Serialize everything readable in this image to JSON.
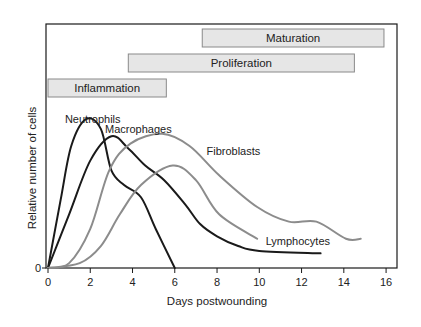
{
  "chart_data": {
    "type": "line",
    "title": "",
    "xlabel": "Days postwounding",
    "ylabel": "Relative number of cells",
    "xlim": [
      0,
      16.5
    ],
    "ylim": [
      0,
      100
    ],
    "x_ticks": [
      0,
      2,
      4,
      6,
      8,
      10,
      12,
      14,
      16
    ],
    "y_ticks": [
      0
    ],
    "grid": false,
    "legend": "inline labels",
    "phases": [
      {
        "name": "Inflammation",
        "start": 0,
        "end": 5.6
      },
      {
        "name": "Proliferation",
        "start": 3.8,
        "end": 14.5
      },
      {
        "name": "Maturation",
        "start": 7.3,
        "end": 15.9
      }
    ],
    "series": [
      {
        "name": "Neutrophils",
        "color": "#1a1a1a",
        "points": [
          [
            0,
            0
          ],
          [
            0.6,
            28
          ],
          [
            1.1,
            50
          ],
          [
            1.8,
            61
          ],
          [
            2.5,
            57
          ],
          [
            3.0,
            40
          ],
          [
            3.6,
            34
          ],
          [
            4.4,
            29
          ],
          [
            5.1,
            16
          ],
          [
            6.0,
            0
          ]
        ]
      },
      {
        "name": "Macrophages",
        "color": "#1a1a1a",
        "points": [
          [
            0,
            0
          ],
          [
            1.0,
            22
          ],
          [
            2.0,
            44
          ],
          [
            3.0,
            54
          ],
          [
            3.8,
            49
          ],
          [
            4.6,
            42
          ],
          [
            5.5,
            36
          ],
          [
            6.5,
            26
          ],
          [
            7.2,
            18
          ],
          [
            8.0,
            13
          ],
          [
            9.0,
            9
          ],
          [
            10.0,
            7
          ],
          [
            12.9,
            6
          ]
        ]
      },
      {
        "name": "Fibroblasts",
        "color": "#8c8c8c",
        "points": [
          [
            0,
            0
          ],
          [
            1.0,
            2
          ],
          [
            2.0,
            16
          ],
          [
            2.9,
            40
          ],
          [
            3.9,
            51
          ],
          [
            5.4,
            55
          ],
          [
            6.7,
            50
          ],
          [
            8.1,
            38
          ],
          [
            9.9,
            25
          ],
          [
            11.4,
            19
          ],
          [
            12.7,
            19
          ],
          [
            14.1,
            12
          ],
          [
            14.8,
            12
          ]
        ]
      },
      {
        "name": "Lymphocytes",
        "color": "#8c8c8c",
        "points": [
          [
            0,
            0
          ],
          [
            1.5,
            2
          ],
          [
            2.5,
            9
          ],
          [
            3.4,
            22
          ],
          [
            4.4,
            34
          ],
          [
            5.9,
            42
          ],
          [
            7.0,
            36
          ],
          [
            8.1,
            22
          ],
          [
            9.9,
            12
          ]
        ]
      }
    ],
    "annotations": [
      {
        "text": "Neutrophils",
        "x": 0.8,
        "y": 61
      },
      {
        "text": "Macrophages",
        "x": 2.7,
        "y": 57
      },
      {
        "text": "Fibroblasts",
        "x": 7.5,
        "y": 48
      },
      {
        "text": "Lymphocytes",
        "x": 10.3,
        "y": 11
      }
    ]
  }
}
